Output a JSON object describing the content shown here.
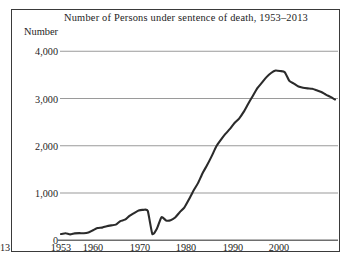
{
  "figure": {
    "title": "Number of Persons under sentence of death, 1953–2013",
    "y_axis_label": "Number"
  },
  "chart_data": {
    "type": "line",
    "title": "Number of Persons under sentence of death, 1953–2013",
    "xlabel": "",
    "ylabel": "Number",
    "xlim": [
      1953,
      2013
    ],
    "ylim": [
      0,
      4000
    ],
    "grid": true,
    "legend": null,
    "ytick_labels": [
      "0",
      "1,000",
      "2,000",
      "3,000",
      "4,000"
    ],
    "ytick_values": [
      0,
      1000,
      2000,
      3000,
      4000
    ],
    "xtick_labels": [
      "1953",
      "1960",
      "1970",
      "1980",
      "1990",
      "2000",
      "2013"
    ],
    "xtick_values": [
      1953,
      1960,
      1970,
      1980,
      1990,
      2000,
      2013
    ],
    "line_color": "#2b2b2b",
    "grid_color": "#9a9a9a",
    "series": [
      {
        "name": "Persons under sentence of death",
        "x": [
          1953,
          1954,
          1955,
          1956,
          1957,
          1958,
          1959,
          1960,
          1961,
          1962,
          1963,
          1964,
          1965,
          1966,
          1967,
          1968,
          1969,
          1970,
          1971,
          1972,
          1973,
          1974,
          1975,
          1976,
          1977,
          1978,
          1979,
          1980,
          1981,
          1982,
          1983,
          1984,
          1985,
          1986,
          1987,
          1988,
          1989,
          1990,
          1991,
          1992,
          1993,
          1994,
          1995,
          1996,
          1997,
          1998,
          1999,
          2000,
          2001,
          2002,
          2003,
          2004,
          2005,
          2006,
          2007,
          2008,
          2009,
          2010,
          2011,
          2012,
          2013
        ],
        "y": [
          131,
          147,
          125,
          146,
          151,
          147,
          164,
          212,
          257,
          267,
          297,
          315,
          331,
          406,
          435,
          517,
          575,
          631,
          642,
          620,
          134,
          244,
          488,
          420,
          423,
          482,
          593,
          691,
          860,
          1050,
          1209,
          1420,
          1591,
          1781,
          1984,
          2124,
          2250,
          2356,
          2482,
          2575,
          2716,
          2890,
          3054,
          3219,
          3335,
          3452,
          3540,
          3593,
          3581,
          3557,
          3374,
          3315,
          3254,
          3228,
          3215,
          3207,
          3173,
          3138,
          3082,
          3033,
          2979
        ]
      }
    ],
    "annotations": [
      {
        "text": "peak near 2000 at about 3,600",
        "x": 2000,
        "y": 3593
      },
      {
        "text": "sharp decline in 1973 to about 134",
        "x": 1973,
        "y": 134
      }
    ]
  }
}
